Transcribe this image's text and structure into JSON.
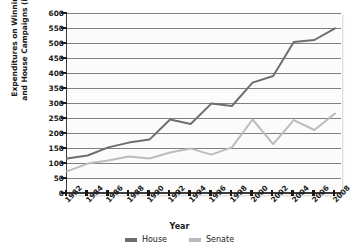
{
  "chart_data": {
    "type": "line",
    "title": "",
    "xlabel": "Year",
    "ylabel": "Expenditures on Winning Senate\nand House Campaigns (in millions)",
    "categories": [
      1982,
      1984,
      1986,
      1988,
      1990,
      1992,
      1994,
      1996,
      1998,
      2000,
      2002,
      2004,
      2006,
      2008
    ],
    "ylim": [
      0,
      600
    ],
    "ytick_step": 50,
    "yticks": [
      0,
      50,
      100,
      150,
      200,
      250,
      300,
      350,
      400,
      450,
      500,
      550,
      600
    ],
    "grid": true,
    "legend_position": "bottom",
    "series": [
      {
        "name": "House",
        "color": "#6e6e6e",
        "values": [
          115,
          125,
          152,
          168,
          178,
          245,
          230,
          298,
          290,
          368,
          390,
          503,
          510,
          549
        ]
      },
      {
        "name": "Senate",
        "color": "#bcbcbc",
        "values": [
          72,
          98,
          108,
          122,
          115,
          135,
          148,
          128,
          152,
          245,
          163,
          243,
          210,
          265
        ]
      }
    ]
  },
  "legend": {
    "items": [
      {
        "label": "House",
        "color": "#6e6e6e"
      },
      {
        "label": "Senate",
        "color": "#bcbcbc"
      }
    ]
  },
  "axes": {
    "x_title": "Year",
    "y_title": "Expenditures on Winning Senate\nand House Campaigns (in millions)"
  }
}
